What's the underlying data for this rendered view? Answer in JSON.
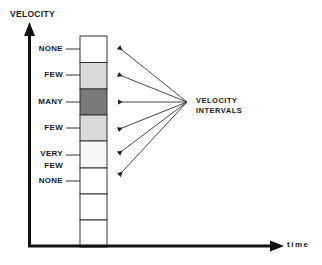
{
  "axes": {
    "y_title": "VELOCITY",
    "x_title": "time"
  },
  "annotation": {
    "line1": "VELOCITY",
    "line2": "INTERVALS"
  },
  "interval_labels": [
    {
      "text": "NONE",
      "y": 49
    },
    {
      "text": "FEW",
      "y": 75
    },
    {
      "text": "MANY",
      "y": 102
    },
    {
      "text": "FEW",
      "y": 128
    },
    {
      "text": "VERY",
      "y": 154
    },
    {
      "text": "FEW",
      "y": 166
    },
    {
      "text": "NONE",
      "y": 181
    }
  ],
  "cells": [
    {
      "fill": "#ffffff"
    },
    {
      "fill": "#d9d9d9"
    },
    {
      "fill": "#7a7a7a"
    },
    {
      "fill": "#d9d9d9"
    },
    {
      "fill": "#f7f7f7"
    },
    {
      "fill": "#ffffff"
    },
    {
      "fill": "#ffffff"
    },
    {
      "fill": "#ffffff"
    }
  ]
}
